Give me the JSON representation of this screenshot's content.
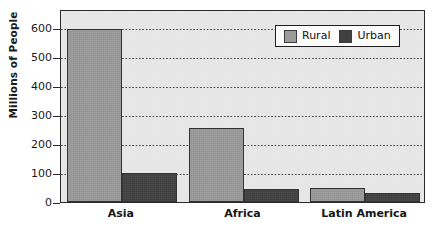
{
  "chart_data": {
    "type": "bar",
    "title": "",
    "subtitle": "",
    "xlabel": "",
    "ylabel": "Millions of People",
    "categories": [
      "Asia",
      "Africa",
      "Latin America"
    ],
    "series": [
      {
        "name": "Rural",
        "values": [
          595,
          255,
          50
        ],
        "color": "#9b9b9b"
      },
      {
        "name": "Urban",
        "values": [
          100,
          45,
          30
        ],
        "color": "#3f3f3f"
      }
    ],
    "ylim": [
      0,
      665
    ],
    "xlim_note": "categorical",
    "yticks": [
      0,
      100,
      200,
      300,
      400,
      500,
      600
    ],
    "ytick_labels": [
      "0",
      "100",
      "200",
      "300",
      "400",
      "500",
      "600"
    ],
    "grid": true,
    "grid_style": "dotted horizontal",
    "legend_position": "top-right inside plot",
    "legend_entries": [
      "Rural",
      "Urban"
    ],
    "plot_background": "#e9e9e9",
    "axis_color": "#2b2b2b"
  },
  "axes": {
    "y_title": "Millions of People"
  },
  "legend": {
    "items": [
      {
        "label": "Rural"
      },
      {
        "label": "Urban"
      }
    ]
  }
}
